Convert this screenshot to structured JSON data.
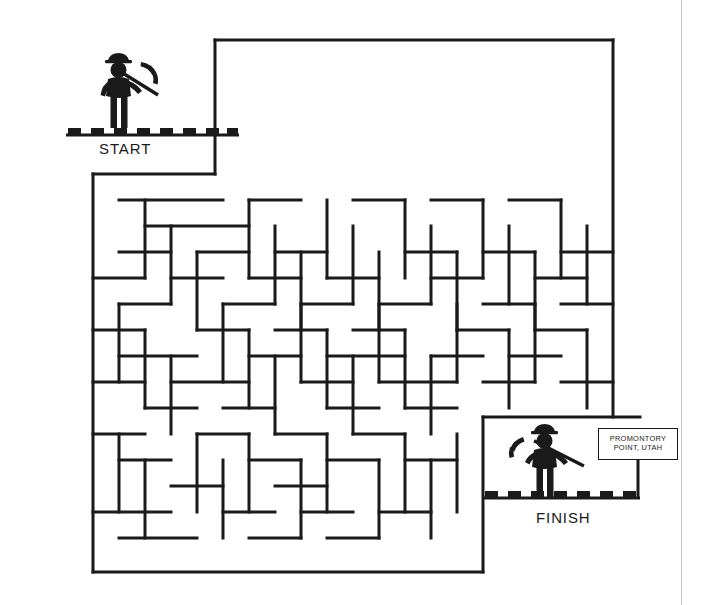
{
  "page": {
    "background_color": "#ffffff",
    "ink_color": "#1a1a1a",
    "width": 712,
    "height": 605
  },
  "labels": {
    "start": "START",
    "finish": "FINISH"
  },
  "sign": {
    "line1": "PROMONTORY",
    "line2": "POINT, UTAH"
  },
  "figures": [
    {
      "name": "miner-start",
      "description": "miner with hard hat holding pickaxe",
      "x": 104,
      "y": 55
    },
    {
      "name": "miner-finish",
      "description": "miner with hard hat holding pickaxe",
      "x": 528,
      "y": 425
    }
  ],
  "maze": {
    "origin_x": 93,
    "origin_y": 40,
    "cell": 26,
    "cols": 20,
    "rows": 20.5,
    "stroke_width": 3,
    "start_gap": {
      "col": 0,
      "row": 0
    },
    "finish_gap": {
      "col": 19,
      "row": 19
    },
    "h_walls": [
      [
        215,
        40,
        613
      ],
      [
        93,
        174,
        215
      ],
      [
        119,
        200,
        223
      ],
      [
        249,
        200,
        301
      ],
      [
        145,
        226,
        249
      ],
      [
        353,
        200,
        405
      ],
      [
        431,
        200,
        483
      ],
      [
        509,
        200,
        561
      ],
      [
        119,
        252,
        171
      ],
      [
        197,
        252,
        249
      ],
      [
        275,
        252,
        327
      ],
      [
        405,
        252,
        457
      ],
      [
        483,
        252,
        535
      ],
      [
        561,
        252,
        613
      ],
      [
        93,
        278,
        145
      ],
      [
        171,
        278,
        223
      ],
      [
        249,
        278,
        301
      ],
      [
        327,
        278,
        379
      ],
      [
        431,
        278,
        483
      ],
      [
        535,
        278,
        587
      ],
      [
        119,
        304,
        171
      ],
      [
        223,
        304,
        275
      ],
      [
        301,
        304,
        353
      ],
      [
        379,
        304,
        431
      ],
      [
        483,
        304,
        535
      ],
      [
        561,
        304,
        613
      ],
      [
        93,
        330,
        145
      ],
      [
        197,
        330,
        249
      ],
      [
        275,
        330,
        327
      ],
      [
        353,
        330,
        405
      ],
      [
        457,
        330,
        509
      ],
      [
        535,
        330,
        587
      ],
      [
        119,
        356,
        197
      ],
      [
        249,
        356,
        301
      ],
      [
        327,
        356,
        405
      ],
      [
        431,
        356,
        483
      ],
      [
        509,
        356,
        561
      ],
      [
        93,
        382,
        145
      ],
      [
        171,
        382,
        249
      ],
      [
        301,
        382,
        353
      ],
      [
        379,
        382,
        457
      ],
      [
        483,
        382,
        535
      ],
      [
        561,
        382,
        613
      ],
      [
        145,
        408,
        197
      ],
      [
        223,
        408,
        275
      ],
      [
        327,
        408,
        379
      ],
      [
        405,
        408,
        457
      ],
      [
        483,
        417,
        640
      ],
      [
        93,
        434,
        145
      ],
      [
        197,
        434,
        249
      ],
      [
        275,
        434,
        327
      ],
      [
        353,
        434,
        405
      ],
      [
        119,
        460,
        171
      ],
      [
        249,
        460,
        301
      ],
      [
        327,
        460,
        379
      ],
      [
        405,
        460,
        457
      ],
      [
        171,
        486,
        223
      ],
      [
        275,
        486,
        327
      ],
      [
        93,
        512,
        171
      ],
      [
        223,
        512,
        275
      ],
      [
        301,
        512,
        353
      ],
      [
        379,
        512,
        431
      ],
      [
        119,
        538,
        197
      ],
      [
        249,
        538,
        301
      ],
      [
        327,
        538,
        379
      ],
      [
        93,
        572,
        483
      ]
    ],
    "v_walls": [
      [
        93,
        174,
        572
      ],
      [
        215,
        40,
        174
      ],
      [
        613,
        40,
        417
      ],
      [
        483,
        417,
        572
      ],
      [
        145,
        200,
        278
      ],
      [
        171,
        226,
        304
      ],
      [
        197,
        252,
        330
      ],
      [
        249,
        200,
        278
      ],
      [
        275,
        226,
        304
      ],
      [
        301,
        252,
        330
      ],
      [
        327,
        200,
        278
      ],
      [
        353,
        226,
        304
      ],
      [
        379,
        252,
        330
      ],
      [
        405,
        200,
        278
      ],
      [
        431,
        226,
        304
      ],
      [
        457,
        252,
        330
      ],
      [
        483,
        200,
        278
      ],
      [
        509,
        226,
        304
      ],
      [
        535,
        252,
        330
      ],
      [
        561,
        200,
        278
      ],
      [
        587,
        226,
        304
      ],
      [
        119,
        304,
        382
      ],
      [
        145,
        330,
        408
      ],
      [
        171,
        356,
        434
      ],
      [
        223,
        304,
        382
      ],
      [
        249,
        330,
        408
      ],
      [
        275,
        356,
        434
      ],
      [
        301,
        304,
        382
      ],
      [
        327,
        330,
        408
      ],
      [
        353,
        356,
        434
      ],
      [
        379,
        304,
        382
      ],
      [
        405,
        330,
        408
      ],
      [
        431,
        356,
        434
      ],
      [
        457,
        304,
        382
      ],
      [
        509,
        330,
        408
      ],
      [
        535,
        304,
        382
      ],
      [
        587,
        330,
        408
      ],
      [
        119,
        434,
        512
      ],
      [
        145,
        460,
        538
      ],
      [
        197,
        434,
        512
      ],
      [
        223,
        460,
        538
      ],
      [
        249,
        434,
        512
      ],
      [
        301,
        460,
        538
      ],
      [
        327,
        434,
        512
      ],
      [
        379,
        460,
        538
      ],
      [
        405,
        434,
        512
      ],
      [
        431,
        460,
        538
      ],
      [
        457,
        434,
        512
      ]
    ]
  }
}
